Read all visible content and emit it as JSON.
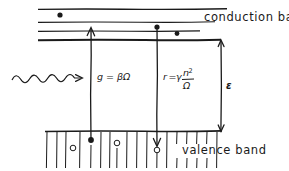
{
  "figure": {
    "type": "semiconductor-band-diagram",
    "width": 289,
    "height": 171,
    "background_color": "#ffffff",
    "ink_color": "#1a1a1a"
  },
  "labels": {
    "conduction_band": "conduction band",
    "valence_band": "valence band",
    "band_gap": "ε"
  },
  "formulas": {
    "generation": {
      "lhs": "g",
      "equals": "=",
      "rhs": "βΩ",
      "full": "g = βΩ"
    },
    "recombination": {
      "lhs": "r",
      "equals": "=",
      "coefficient": "γ",
      "numerator": "n",
      "numerator_exponent": "2",
      "denominator": "Ω",
      "full": "r = γ n²/Ω"
    }
  },
  "bands": {
    "conduction_lines": [
      {
        "name": "conduction-line-1",
        "x1": 38,
        "x2": 227,
        "y": 9
      },
      {
        "name": "conduction-line-2",
        "x1": 38,
        "x2": 215,
        "y": 22
      },
      {
        "name": "conduction-line-3",
        "x1": 38,
        "x2": 200,
        "y": 31
      },
      {
        "name": "conduction-band-edge",
        "x1": 38,
        "x2": 221,
        "y": 40
      }
    ],
    "valence_top_edge": {
      "x1": 45,
      "x2": 222,
      "y": 131
    },
    "valence_hatch_bottom": 168,
    "valence_hatch_count": 17
  },
  "carriers": {
    "electrons": [
      {
        "name": "electron-upper-band",
        "x": 60,
        "y": 15,
        "r": 2.6
      },
      {
        "name": "electron-mid-band",
        "x": 157,
        "y": 27,
        "r": 2.6
      },
      {
        "name": "electron-near-edge",
        "x": 177,
        "y": 33,
        "r": 2.4
      },
      {
        "name": "electron-generated",
        "x": 91,
        "y": 140,
        "r": 2.8
      }
    ],
    "holes": [
      {
        "name": "hole-left",
        "x": 73,
        "y": 148,
        "r": 2.8
      },
      {
        "name": "hole-middle",
        "x": 117,
        "y": 143,
        "r": 2.8
      },
      {
        "name": "hole-recombination",
        "x": 157,
        "y": 146,
        "r": 2.8
      }
    ]
  },
  "arrows": {
    "generation_arrow": {
      "name": "generation-arrow-up",
      "x": 91,
      "y_from": 140,
      "y_to": 28,
      "direction": "up"
    },
    "recombination_arrow": {
      "name": "recombination-arrow-down",
      "x": 157,
      "y_from": 27,
      "y_to": 146,
      "direction": "down"
    },
    "gap_arrow": {
      "name": "band-gap-double-arrow",
      "x": 221,
      "y_top": 40,
      "y_bottom": 131,
      "direction": "both"
    },
    "photon": {
      "name": "incident-photon-wave",
      "x_start": 12,
      "x_end": 80,
      "y": 79,
      "wave_cycles": 4,
      "amplitude": 5
    }
  }
}
